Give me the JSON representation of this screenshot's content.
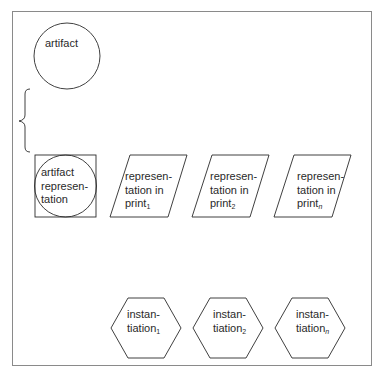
{
  "diagram": {
    "artifact": {
      "label": "artifact"
    },
    "artifact_representation": {
      "lines": [
        "artifact",
        "represen-",
        "tation"
      ]
    },
    "representations": [
      {
        "lines": [
          "represen-",
          "tation in",
          "print"
        ],
        "subscript": "1"
      },
      {
        "lines": [
          "represen-",
          "tation in",
          "print"
        ],
        "subscript": "2"
      },
      {
        "lines": [
          "represen-",
          "tation in",
          "print"
        ],
        "subscript": "n"
      }
    ],
    "instantiations": [
      {
        "lines": [
          "instan-",
          "tiation"
        ],
        "subscript": "1"
      },
      {
        "lines": [
          "instan-",
          "tiation"
        ],
        "subscript": "2"
      },
      {
        "lines": [
          "instan-",
          "tiation"
        ],
        "subscript": "n"
      }
    ],
    "colors": {
      "stroke": "#2a2a2a",
      "frame": "#8a8a8a",
      "background": "#ffffff"
    }
  }
}
